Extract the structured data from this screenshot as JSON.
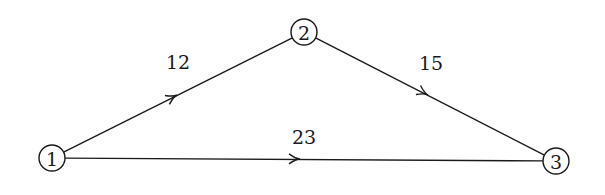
{
  "diagram": {
    "type": "directed-weighted-graph",
    "colors": {
      "stroke": "#1a1a1a",
      "background": "#ffffff"
    },
    "nodes": [
      {
        "id": "1",
        "label": "1",
        "x": 52,
        "y": 158,
        "r": 13
      },
      {
        "id": "2",
        "label": "2",
        "x": 304,
        "y": 32,
        "r": 13
      },
      {
        "id": "3",
        "label": "3",
        "x": 556,
        "y": 161,
        "r": 13
      }
    ],
    "edges": [
      {
        "from": "1",
        "to": "2",
        "weight": "12",
        "label_x": 178,
        "label_y": 69,
        "arrow_x": 177,
        "arrow_y": 95
      },
      {
        "from": "2",
        "to": "3",
        "weight": "15",
        "label_x": 431,
        "label_y": 70,
        "arrow_x": 428,
        "arrow_y": 95
      },
      {
        "from": "1",
        "to": "3",
        "weight": "23",
        "label_x": 304,
        "label_y": 144,
        "arrow_x": 300,
        "arrow_y": 159
      }
    ]
  }
}
